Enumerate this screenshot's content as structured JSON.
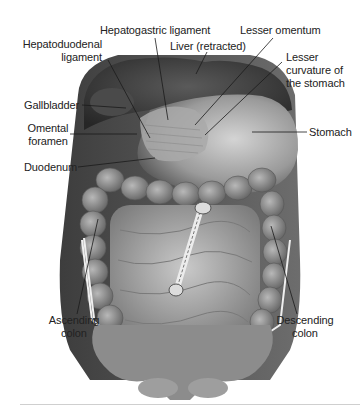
{
  "figure": {
    "labels": {
      "hepatogastric_ligament": "Hepatogastric ligament",
      "lesser_omentum": "Lesser omentum",
      "hepatoduodenal_ligament_line1": "Hepatoduodenal",
      "hepatoduodenal_ligament_line2": "ligament",
      "liver": "Liver (retracted)",
      "lesser_curvature_line1": "Lesser",
      "lesser_curvature_line2": "curvature of",
      "lesser_curvature_line3": "the stomach",
      "gallbladder": "Gallbladder",
      "omental_foramen_line1": "Omental",
      "omental_foramen_line2": "foramen",
      "stomach": "Stomach",
      "duodenum": "Duodenum",
      "ascending_colon_line1": "Ascending",
      "ascending_colon_line2": "colon",
      "descending_colon_line1": "Descending",
      "descending_colon_line2": "colon"
    },
    "colors": {
      "background": "#ffffff",
      "label_text": "#222222",
      "leader_line": "#1a1a1a",
      "tissue_dark": "#3a3a3a",
      "tissue_mid": "#7a7a7a",
      "tissue_light": "#bdbdbd",
      "retractor": "#e8e8e8"
    }
  }
}
